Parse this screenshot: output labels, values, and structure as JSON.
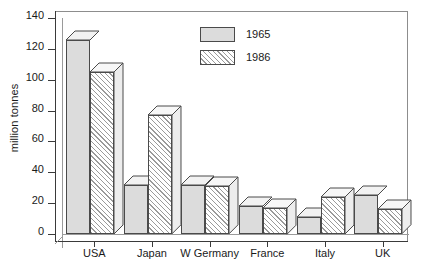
{
  "chart_data": {
    "type": "bar",
    "title": "",
    "xlabel": "",
    "ylabel": "million tonnes",
    "ylim": [
      0,
      140
    ],
    "yticks": [
      0,
      20,
      40,
      60,
      80,
      100,
      120,
      140
    ],
    "grid": false,
    "legend_position": "top-center",
    "categories": [
      "USA",
      "Japan",
      "W Germany",
      "France",
      "Italy",
      "UK"
    ],
    "series": [
      {
        "name": "1965",
        "values": [
          126,
          32,
          32,
          18,
          11,
          25
        ]
      },
      {
        "name": "1986",
        "values": [
          105,
          77,
          31,
          17,
          24,
          16
        ]
      }
    ]
  },
  "legend": {
    "items": [
      {
        "label": "1965"
      },
      {
        "label": "1986"
      }
    ]
  },
  "axes": {
    "y_title": "million tonnes",
    "y_tick_labels": [
      "140",
      "120",
      "100",
      "80",
      "60",
      "40",
      "20",
      "0"
    ],
    "x_tick_labels": [
      "USA",
      "Japan",
      "W Germany",
      "France",
      "Italy",
      "UK"
    ]
  },
  "style": {
    "series_1965_fill": "#dcdcdc",
    "series_1986_fill": "#ffffff",
    "hatch_color": "#9a9a9a",
    "outline": "#4a4a4a",
    "axis": "#3a3a3a",
    "frame": "#8d8d8d",
    "text": "#1a1a1a",
    "background": "#ffffff"
  },
  "title_strip": ""
}
